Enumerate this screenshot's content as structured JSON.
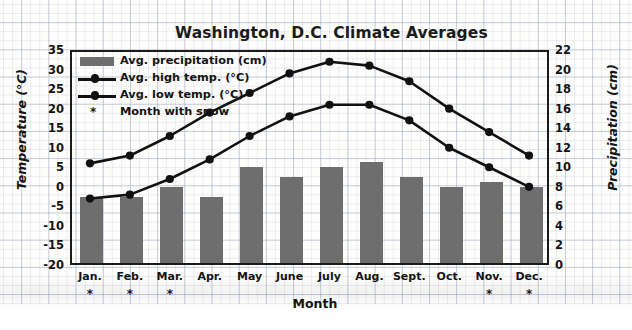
{
  "chart_data": {
    "type": "bar",
    "title": "Washington, D.C. Climate Averages",
    "xlabel": "Month",
    "ylabel": "Temperature (°C)",
    "y2label": "Precipitation (cm)",
    "grid": true,
    "legend_position": "top-left",
    "categories": [
      "Jan.",
      "Feb.",
      "Mar.",
      "Apr.",
      "May",
      "June",
      "July",
      "Aug.",
      "Sept.",
      "Oct.",
      "Nov.",
      "Dec."
    ],
    "ylim": [
      -20,
      35
    ],
    "yticks": [
      35,
      30,
      25,
      20,
      15,
      10,
      5,
      0,
      -5,
      -10,
      -15,
      -20
    ],
    "y2lim": [
      0,
      22
    ],
    "y2ticks": [
      22,
      20,
      18,
      16,
      14,
      12,
      10,
      8,
      6,
      4,
      2,
      0
    ],
    "series": [
      {
        "name": "Avg. precipitation (cm)",
        "type": "bar",
        "axis": "y2",
        "color": "#6e6e6e",
        "values": [
          7.0,
          7.0,
          8.0,
          7.0,
          10.0,
          9.0,
          10.0,
          10.5,
          9.0,
          8.0,
          8.5,
          8.0
        ]
      },
      {
        "name": "Avg. high temp. (°C)",
        "type": "line",
        "axis": "y",
        "color": "#111111",
        "values": [
          6,
          8,
          13,
          19,
          24,
          29,
          32,
          31,
          27,
          20,
          14,
          8
        ]
      },
      {
        "name": "Avg. low temp. (°C)",
        "type": "line",
        "axis": "y",
        "color": "#111111",
        "values": [
          -3,
          -2,
          2,
          7,
          13,
          18,
          21,
          21,
          17,
          10,
          5,
          0
        ]
      }
    ],
    "annotation": {
      "symbol": "*",
      "label": "Month with snow",
      "months": [
        "Jan.",
        "Feb.",
        "Mar.",
        "Nov.",
        "Dec."
      ]
    }
  },
  "legend": {
    "items": [
      {
        "label": "Avg. precipitation (cm)",
        "key": "bar"
      },
      {
        "label": "Avg. high temp. (°C)",
        "key": "line"
      },
      {
        "label": "Avg. low temp. (°C)",
        "key": "line"
      },
      {
        "label": "Month with snow",
        "key": "star"
      }
    ]
  }
}
